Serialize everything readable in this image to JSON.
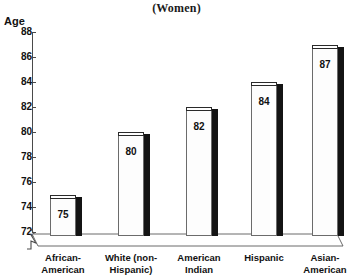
{
  "chart_data": {
    "type": "bar",
    "title": "(Women)",
    "xlabel": "",
    "ylabel": "Age",
    "ylim": [
      72,
      88
    ],
    "yticks": [
      88,
      86,
      84,
      82,
      80,
      78,
      76,
      74,
      72
    ],
    "grid": false,
    "legend": null,
    "axis_break": true,
    "categories": [
      "African-American",
      "White (non-Hispanic)",
      "American Indian",
      "Hispanic",
      "Asian-American"
    ],
    "category_lines": [
      [
        "African-",
        "American"
      ],
      [
        "White (non-",
        "Hispanic)"
      ],
      [
        "American",
        "Indian"
      ],
      [
        "Hispanic",
        ""
      ],
      [
        "Asian-",
        "American"
      ]
    ],
    "values": [
      75,
      80,
      82,
      84,
      87
    ],
    "value_labels": [
      "75",
      "80",
      "82",
      "84",
      "87"
    ]
  },
  "style": {
    "bar_face_color": "#fdfdfd",
    "bar_side_color": "#141414",
    "bar_outline_color": "#6b6b6b",
    "axis_color": "#4a4a4a",
    "text_color": "#111111",
    "background": "#ffffff"
  }
}
